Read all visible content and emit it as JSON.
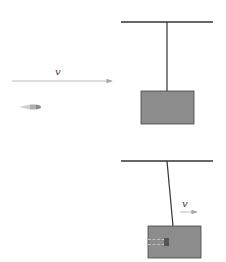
{
  "diagram": {
    "before": {
      "velocity_label": "v",
      "arrow_color": "#9a9a9a",
      "block_color": "#8c8c8c"
    },
    "after": {
      "velocity_label": "v"
    },
    "colors": {
      "line": "#333333",
      "block_fill": "#8c8c8c",
      "block_stroke": "#444444",
      "arrow": "#aaaaaa"
    }
  }
}
